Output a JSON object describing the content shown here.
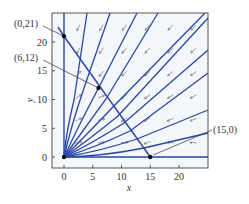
{
  "diagram": {
    "type": "phase_portrait",
    "xlabel": "x",
    "ylabel": "y",
    "x_ticks": [
      0,
      5,
      10,
      15,
      20
    ],
    "y_ticks": [
      0,
      5,
      10,
      15,
      20
    ],
    "x_range": [
      -2,
      25
    ],
    "y_range": [
      -2,
      25
    ],
    "colors": {
      "trajectory": "#2a45a6",
      "frame": "#555555",
      "field_arrow": "#777777",
      "point": "#111111",
      "background": "#f3f6fb"
    },
    "points": [
      {
        "label": "(0,21)",
        "x": 0,
        "y": 21
      },
      {
        "label": "(6,12)",
        "x": 6,
        "y": 12
      },
      {
        "label": "(15,0)",
        "x": 15,
        "y": 0
      },
      {
        "label": "",
        "x": 0,
        "y": 0
      }
    ],
    "separatrix": {
      "from": [
        0,
        21
      ],
      "to": [
        15,
        0
      ]
    }
  }
}
